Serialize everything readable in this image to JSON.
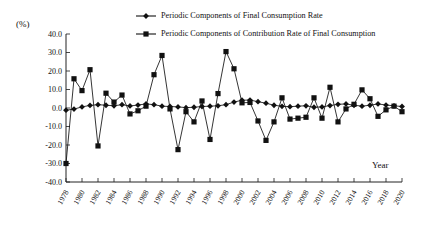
{
  "chart_data": {
    "type": "line",
    "title": "",
    "xlabel": "Year",
    "ylabel": "(%)",
    "ylim": [
      -40.0,
      40.0
    ],
    "xlim": [
      1978,
      2020
    ],
    "grid": false,
    "legend_position": "top-center",
    "y_ticks": [
      "40.0",
      "30.0",
      "20.0",
      "10.0",
      "0.0",
      "-10.0",
      "-20.0",
      "-30.0",
      "-40.0"
    ],
    "y_tick_values": [
      40.0,
      30.0,
      20.0,
      10.0,
      0.0,
      -10.0,
      -20.0,
      -30.0,
      -40.0
    ],
    "x_tick_labels": [
      "1978",
      "1980",
      "1982",
      "1984",
      "1986",
      "1988",
      "1990",
      "1992",
      "1994",
      "1996",
      "1998",
      "2000",
      "2002",
      "2004",
      "2006",
      "2008",
      "2010",
      "2012",
      "2014",
      "2016",
      "2018",
      "2020"
    ],
    "x": [
      1978,
      1979,
      1980,
      1981,
      1982,
      1983,
      1984,
      1985,
      1986,
      1987,
      1988,
      1989,
      1990,
      1991,
      1992,
      1993,
      1994,
      1995,
      1996,
      1997,
      1998,
      1999,
      2000,
      2001,
      2002,
      2003,
      2004,
      2005,
      2006,
      2007,
      2008,
      2009,
      2010,
      2011,
      2012,
      2013,
      2014,
      2015,
      2016,
      2017,
      2018,
      2019,
      2020
    ],
    "series": [
      {
        "name": "Periodic Components of Final Consumption Rate",
        "marker": "diamond",
        "color": "#111111",
        "values": [
          -1.2,
          -0.6,
          0.6,
          1.4,
          1.8,
          1.5,
          1.2,
          1.8,
          1.1,
          1.6,
          2.2,
          1.8,
          1.0,
          0.8,
          0.6,
          0.2,
          0.4,
          0.8,
          1.0,
          1.2,
          1.8,
          3.2,
          4.2,
          4.3,
          3.4,
          2.6,
          1.5,
          0.9,
          0.7,
          1.0,
          1.2,
          0.4,
          0.6,
          1.3,
          2.0,
          2.2,
          1.5,
          1.0,
          1.5,
          2.2,
          1.6,
          1.2,
          0.8
        ]
      },
      {
        "name": "Periodic Components of Contribution Rate of Final Consumption",
        "marker": "square",
        "color": "#111111",
        "values": [
          -30.0,
          15.8,
          9.4,
          20.7,
          -20.5,
          8.0,
          3.2,
          7.0,
          -3.2,
          -1.5,
          1.0,
          18.0,
          28.4,
          -0.5,
          -22.5,
          -2.0,
          -7.5,
          3.8,
          -17.0,
          7.8,
          30.5,
          21.2,
          2.8,
          3.0,
          -7.0,
          -17.5,
          -7.5,
          5.5,
          -6.0,
          -5.5,
          -5.0,
          5.5,
          -5.5,
          11.2,
          -7.5,
          -0.5,
          2.0,
          9.8,
          5.0,
          -4.5,
          -1.0,
          1.0,
          -2.0
        ]
      }
    ]
  },
  "axis": {
    "unit_label": "(%)",
    "x_axis_name": "Year"
  },
  "legend": {
    "items": [
      {
        "label": "Periodic Components of Final Consumption Rate",
        "marker": "diamond"
      },
      {
        "label": "Periodic Components of Contribution Rate of Final Consumption",
        "marker": "square"
      }
    ]
  }
}
